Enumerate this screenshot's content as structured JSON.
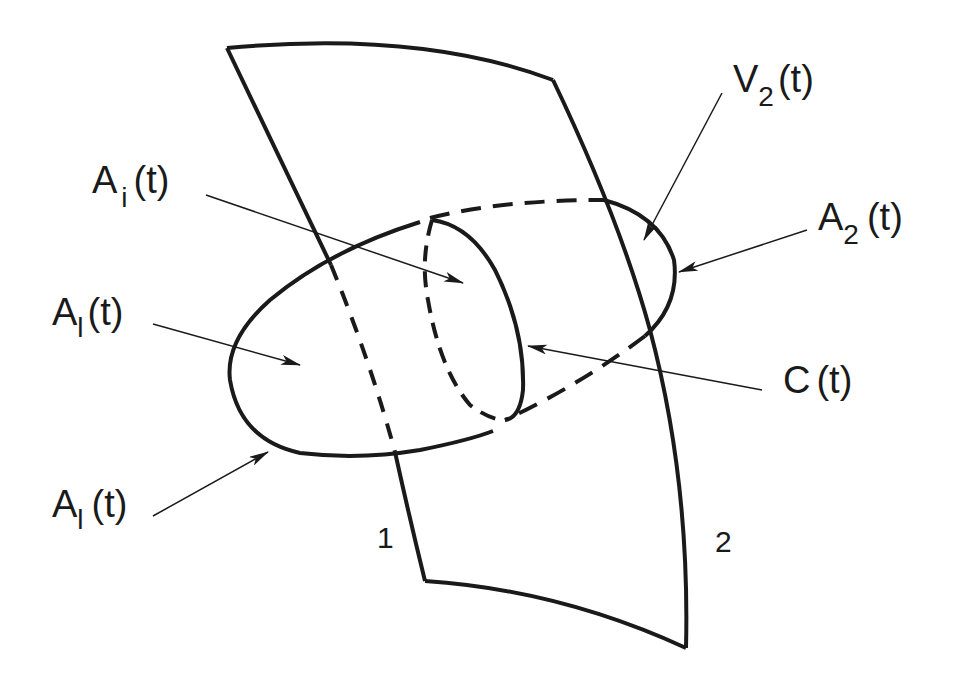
{
  "diagram": {
    "type": "surface-intersection-schematic",
    "colors": {
      "ink": "#1a1a1a",
      "background": "#ffffff"
    },
    "surface": {
      "label_left_edge": "1",
      "label_right_edge": "2"
    },
    "labels": {
      "a_i": {
        "base": "A",
        "sub": "i",
        "suffix": "(t)"
      },
      "v_2": {
        "base": "V",
        "sub": "2",
        "suffix": "(t)"
      },
      "a_2": {
        "base": "A",
        "sub": "2",
        "suffix": "(t)"
      },
      "a_l_upper": {
        "base": "A",
        "sub": "l",
        "suffix": "(t)"
      },
      "c": {
        "base": "C",
        "sub": "",
        "suffix": "(t)"
      },
      "a_l_lower": {
        "base": "A",
        "sub": "l",
        "suffix": "(t)"
      }
    }
  }
}
